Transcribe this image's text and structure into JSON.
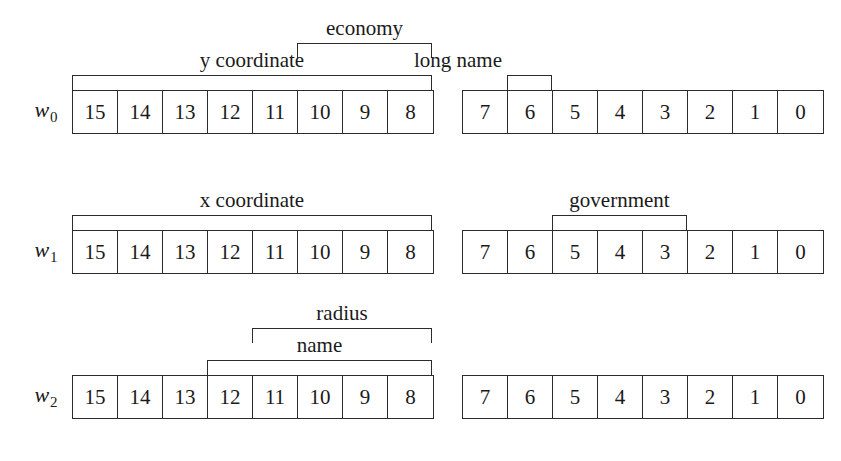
{
  "diagram": {
    "kind": "bit-field-layout",
    "bits_per_block": 8,
    "words": [
      {
        "name": "w",
        "subscript": "0",
        "left_bits": [
          "15",
          "14",
          "13",
          "12",
          "11",
          "10",
          "9",
          "8"
        ],
        "right_bits": [
          "7",
          "6",
          "5",
          "4",
          "3",
          "2",
          "1",
          "0"
        ],
        "fields": [
          {
            "label": "y coordinate",
            "from_bit": 15,
            "to_bit": 8,
            "tier": 0
          },
          {
            "label": "economy",
            "from_bit": 10,
            "to_bit": 8,
            "tier": 1
          },
          {
            "label": "long name",
            "from_bit": 6,
            "to_bit": 6,
            "tier": 0
          }
        ]
      },
      {
        "name": "w",
        "subscript": "1",
        "left_bits": [
          "15",
          "14",
          "13",
          "12",
          "11",
          "10",
          "9",
          "8"
        ],
        "right_bits": [
          "7",
          "6",
          "5",
          "4",
          "3",
          "2",
          "1",
          "0"
        ],
        "fields": [
          {
            "label": "x coordinate",
            "from_bit": 15,
            "to_bit": 8,
            "tier": 0
          },
          {
            "label": "government",
            "from_bit": 5,
            "to_bit": 3,
            "tier": 0
          }
        ]
      },
      {
        "name": "w",
        "subscript": "2",
        "left_bits": [
          "15",
          "14",
          "13",
          "12",
          "11",
          "10",
          "9",
          "8"
        ],
        "right_bits": [
          "7",
          "6",
          "5",
          "4",
          "3",
          "2",
          "1",
          "0"
        ],
        "fields": [
          {
            "label": "name",
            "from_bit": 12,
            "to_bit": 8,
            "tier": 0
          },
          {
            "label": "radius",
            "from_bit": 11,
            "to_bit": 8,
            "tier": 1
          }
        ]
      }
    ]
  },
  "colors": {
    "background": "#ffffff",
    "line": "#2b2b2b",
    "text": "#1a1a1a"
  }
}
